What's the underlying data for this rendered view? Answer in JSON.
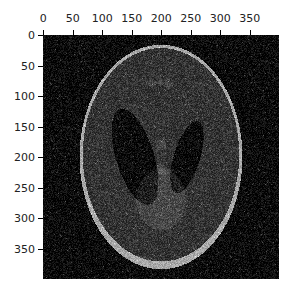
{
  "figure": {
    "image": {
      "description": "Noisy Shepp-Logan phantom (grayscale)",
      "size_px": [
        400,
        400
      ],
      "background_color": "#0a0a0a",
      "colormap": "gray"
    },
    "x_axis": {
      "position": "top",
      "ticks": [
        0,
        50,
        100,
        150,
        200,
        250,
        300,
        350
      ],
      "tick_labels": [
        "0",
        "50",
        "100",
        "150",
        "200",
        "250",
        "300",
        "350"
      ],
      "range": [
        0,
        400
      ]
    },
    "y_axis": {
      "position": "left",
      "ticks": [
        0,
        50,
        100,
        150,
        200,
        250,
        300,
        350
      ],
      "tick_labels": [
        "0",
        "50",
        "100",
        "150",
        "200",
        "250",
        "300",
        "350"
      ],
      "range": [
        0,
        400
      ]
    }
  }
}
